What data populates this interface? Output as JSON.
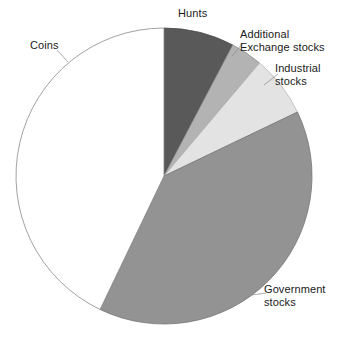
{
  "chart_data": {
    "type": "pie",
    "title": "",
    "subtitle": "",
    "xlabel": "",
    "ylabel": "",
    "grid": false,
    "legend_position": "none",
    "label_placement": "outside-with-leader-lines",
    "start_angle_deg": 0,
    "direction": "clockwise",
    "center": {
      "x": 164,
      "y": 176
    },
    "radius": 148,
    "categories": [
      "Hunts",
      "Additional Exchange stocks",
      "Industrial stocks",
      "Government stocks",
      "Coins"
    ],
    "values": [
      7.7,
      3.5,
      6.7,
      39.2,
      42.9
    ],
    "slices": [
      {
        "label": "Hunts",
        "label_lines": [
          "Hunts"
        ],
        "value": 7.7,
        "start_deg": 0.0,
        "end_deg": 27.7,
        "color": "#595959",
        "stroke": "#4a4a4a",
        "leader_line": false
      },
      {
        "label": "Additional Exchange stocks",
        "label_lines": [
          "Additional",
          "Exchange stocks"
        ],
        "value": 3.5,
        "start_deg": 27.7,
        "end_deg": 40.2,
        "color": "#b3b3b3",
        "stroke": "#8f8f8f",
        "leader_line": true
      },
      {
        "label": "Industrial stocks",
        "label_lines": [
          "Industrial",
          "stocks"
        ],
        "value": 6.7,
        "start_deg": 40.2,
        "end_deg": 64.4,
        "color": "#e3e3e3",
        "stroke": "#b8b8b8",
        "leader_line": true
      },
      {
        "label": "Government stocks",
        "label_lines": [
          "Government",
          "stocks"
        ],
        "value": 39.2,
        "start_deg": 64.4,
        "end_deg": 205.6,
        "color": "#939393",
        "stroke": "#767676",
        "leader_line": true
      },
      {
        "label": "Coins",
        "label_lines": [
          "Coins"
        ],
        "value": 42.9,
        "start_deg": 205.6,
        "end_deg": 360.0,
        "color": "#ffffff",
        "stroke": "#8a8a8a",
        "leader_line": true
      }
    ]
  },
  "labels": {
    "hunts": "Hunts",
    "additional": "Additional\nExchange stocks",
    "industrial": "Industrial\nstocks",
    "government": "Government\nstocks",
    "coins": "Coins"
  }
}
